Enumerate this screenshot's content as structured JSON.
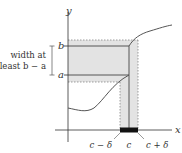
{
  "figure": {
    "axis_labels": {
      "x": "x",
      "y": "y"
    },
    "y_ticks": {
      "b": "b",
      "a": "a"
    },
    "x_ticks": {
      "left": "c − δ",
      "center": "c",
      "right": "c + δ"
    },
    "annotation": {
      "line1": "width at",
      "line2": "least b − a"
    },
    "colors": {
      "shade": "#e3e3e3",
      "axis": "#333333",
      "curve": "#555555",
      "dashed": "#777777",
      "bar": "#111111"
    }
  }
}
